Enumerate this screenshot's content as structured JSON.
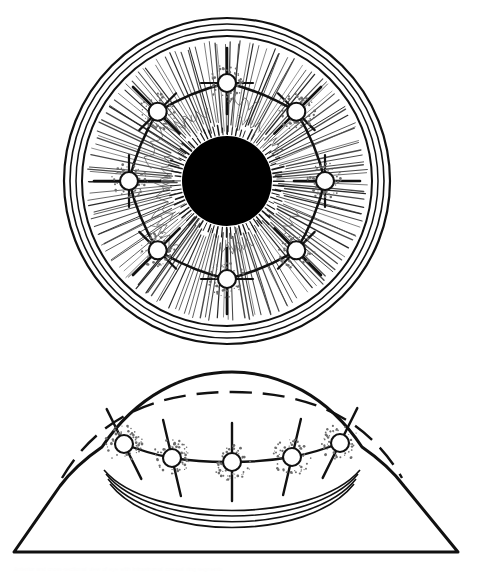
{
  "figure": {
    "title": "Anterior and cross-sectional view of eye with intrastromal corneal ring segments",
    "background_color": "#ffffff",
    "ink_color": "#111111",
    "pupil_color": "#000000",
    "fiber_color": "#4a4a4a",
    "width": 482,
    "height": 577,
    "panels": [
      {
        "id": "frontal-view",
        "name": "Frontal view of eye",
        "center_x": 227,
        "center_y": 181,
        "limbus_rings": [
          163,
          157,
          151,
          145
        ],
        "iris_outer_radius": 142,
        "pupil_radius": 45,
        "bead_ring_radius": 98,
        "bead_count": 8,
        "bead_radius": 9,
        "bead_angles_deg": [
          270,
          315,
          0,
          45,
          90,
          135,
          180,
          225
        ],
        "iris_fiber_count": 150,
        "crypt_ring_radius": 74
      },
      {
        "id": "cross-section-view",
        "name": "Cross-sectional side view of eye",
        "baseline_y": 552,
        "baseline_x_start": 14,
        "baseline_x_end": 458,
        "dome_apex_x": 232,
        "dome_apex_y": 372,
        "bead_count": 5,
        "bead_radius": 9,
        "bead_positions": [
          {
            "x": 124,
            "y": 444
          },
          {
            "x": 172,
            "y": 458
          },
          {
            "x": 232,
            "y": 462
          },
          {
            "x": 292,
            "y": 457
          },
          {
            "x": 340,
            "y": 443
          }
        ],
        "inner_arc_count": 4,
        "has_dashed_preop_profile": true
      }
    ]
  }
}
